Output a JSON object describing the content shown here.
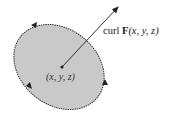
{
  "diagram": {
    "vector_label": {
      "prefix": "curl ",
      "symbol": "F",
      "args": "(x, y, z)"
    },
    "point_label": "(x, y, z)",
    "colors": {
      "disk_fill": "#c9c9c9",
      "outline": "#333333",
      "arrow": "#222222"
    },
    "elements": [
      "tilted elliptical disk",
      "boundary circulation arrows (3)",
      "normal vector arrow from center"
    ]
  }
}
